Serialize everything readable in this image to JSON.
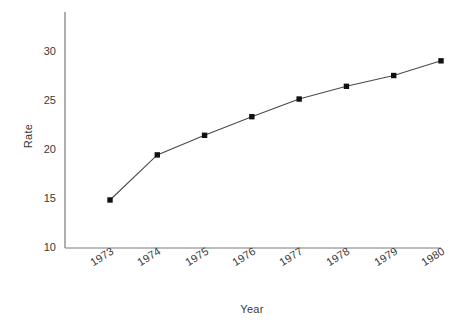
{
  "chart_data": {
    "type": "line",
    "title": "",
    "xlabel": "Year",
    "ylabel": "Rate",
    "categories": [
      "1973",
      "1974",
      "1975",
      "1976",
      "1977",
      "1978",
      "1979",
      "1980"
    ],
    "x": [
      1973,
      1974,
      1975,
      1976,
      1977,
      1978,
      1979,
      1980
    ],
    "values": [
      14.9,
      19.5,
      21.5,
      23.4,
      25.2,
      26.5,
      27.6,
      29.1
    ],
    "series": [
      {
        "name": "Rate",
        "values": [
          14.9,
          19.5,
          21.5,
          23.4,
          25.2,
          26.5,
          27.6,
          29.1
        ]
      }
    ],
    "ylim": [
      10,
      30
    ],
    "yticks": [
      10,
      15,
      20,
      25,
      30
    ],
    "yticklabels": [
      "10",
      "15",
      "20",
      "25",
      "30"
    ],
    "xlim": [
      1972.6,
      1980.4
    ],
    "grid": false,
    "legend": false,
    "legend_position": "none",
    "marker": "square",
    "marker_color": "#111111",
    "line_color": "#4a4a4a",
    "axis_color": "#7a7a7a",
    "background": "#ffffff",
    "text_color": "#3a3a3a"
  },
  "axes": {
    "y_title": "Rate",
    "x_title": "Year"
  }
}
